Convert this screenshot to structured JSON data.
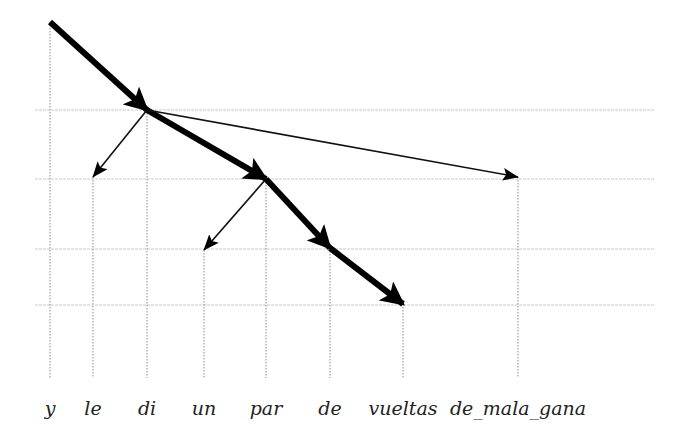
{
  "diagram": {
    "type": "dependency-tree",
    "words": [
      {
        "id": "y",
        "label": "y",
        "x": 50,
        "level_y": 22
      },
      {
        "id": "le",
        "label": "le",
        "x": 93,
        "level_y": 177
      },
      {
        "id": "di",
        "label": "di",
        "x": 147,
        "level_y": 110
      },
      {
        "id": "un",
        "label": "un",
        "x": 204,
        "level_y": 250
      },
      {
        "id": "par",
        "label": "par",
        "x": 266,
        "level_y": 179
      },
      {
        "id": "de",
        "label": "de",
        "x": 330,
        "level_y": 248
      },
      {
        "id": "vueltas",
        "label": "vueltas",
        "x": 403,
        "level_y": 304
      },
      {
        "id": "de_mala_gana",
        "label": "de_mala_gana",
        "x": 518,
        "level_y": 177
      }
    ],
    "levels_y": [
      110,
      179,
      249,
      305
    ],
    "edges": [
      {
        "from": "y",
        "to": "di",
        "style": "thick"
      },
      {
        "from": "di",
        "to": "le",
        "style": "thin"
      },
      {
        "from": "di",
        "to": "par",
        "style": "thick"
      },
      {
        "from": "di",
        "to": "de_mala_gana",
        "style": "thin"
      },
      {
        "from": "par",
        "to": "un",
        "style": "thin"
      },
      {
        "from": "par",
        "to": "de",
        "style": "thick"
      },
      {
        "from": "de",
        "to": "vueltas",
        "style": "thick"
      }
    ],
    "colors": {
      "edge": "#000000",
      "grid": "#c9c9c9",
      "guide": "#8c8c8c",
      "text": "#222222"
    }
  }
}
